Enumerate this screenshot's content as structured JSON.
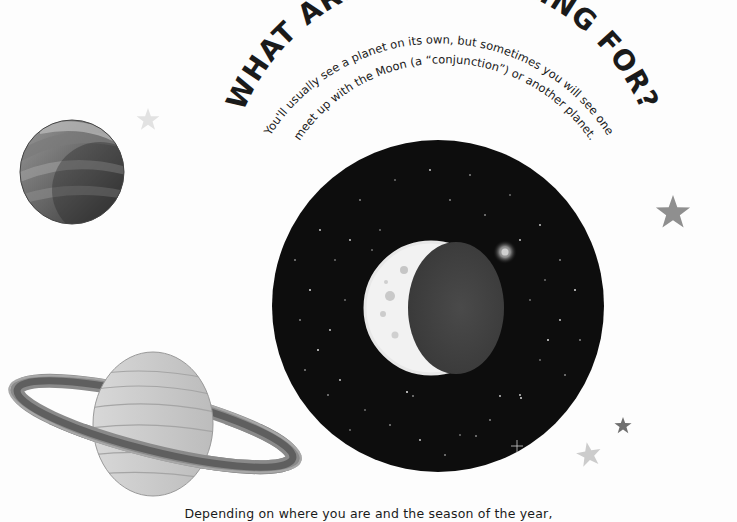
{
  "page": {
    "title": "WHAT ARE YOU LOOKING FOR?",
    "intro_line_1": "You'll usually see a planet on its own, but sometimes you will see one",
    "intro_line_2": "meet up with the Moon (a “conjunction”) or another planet.",
    "footer_text": "Depending on where you are and the season of the year,"
  },
  "illustrations": {
    "night_sky": {
      "label": "night-sky-circle",
      "color": "#0d0d0d"
    },
    "moon": {
      "label": "crescent-moon",
      "phase": "waxing crescent"
    },
    "bright_planet": {
      "label": "bright-planet-glow"
    },
    "planet_top_left": {
      "label": "banded-planet"
    },
    "saturn": {
      "label": "ringed-planet"
    },
    "stars": [
      {
        "x": 148,
        "y": 120,
        "size": 12,
        "color": "#e2e2e2"
      },
      {
        "x": 673,
        "y": 213,
        "size": 18,
        "color": "#8f8f8f"
      },
      {
        "x": 623,
        "y": 426,
        "size": 9,
        "color": "#6f6f6f"
      },
      {
        "x": 589,
        "y": 455,
        "size": 13,
        "color": "#cccccc"
      }
    ]
  }
}
